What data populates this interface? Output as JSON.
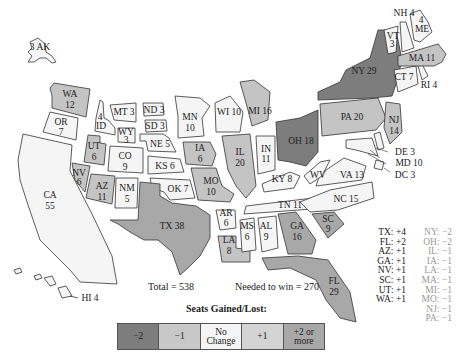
{
  "colors": {
    "minus2": "#7d7d7d",
    "minus1": "#c8c8c8",
    "no_change": "#f5f5f5",
    "plus1": "#d4d4d4",
    "plus2": "#a8a8a8",
    "outline": "#333333"
  },
  "states": [
    {
      "abbr": "AK",
      "votes": 3,
      "change": 0
    },
    {
      "abbr": "WA",
      "votes": 12,
      "change": 1
    },
    {
      "abbr": "OR",
      "votes": 7,
      "change": 0
    },
    {
      "abbr": "CA",
      "votes": 55,
      "change": 0
    },
    {
      "abbr": "ID",
      "votes": 4,
      "change": 0
    },
    {
      "abbr": "NV",
      "votes": 6,
      "change": 1
    },
    {
      "abbr": "UT",
      "votes": 6,
      "change": 1
    },
    {
      "abbr": "AZ",
      "votes": 11,
      "change": 1
    },
    {
      "abbr": "MT",
      "votes": 3,
      "change": 0
    },
    {
      "abbr": "WY",
      "votes": 3,
      "change": 0
    },
    {
      "abbr": "CO",
      "votes": 9,
      "change": 0
    },
    {
      "abbr": "NM",
      "votes": 5,
      "change": 0
    },
    {
      "abbr": "ND",
      "votes": 3,
      "change": 0
    },
    {
      "abbr": "SD",
      "votes": 3,
      "change": 0
    },
    {
      "abbr": "NE",
      "votes": 5,
      "change": 0
    },
    {
      "abbr": "KS",
      "votes": 6,
      "change": 0
    },
    {
      "abbr": "OK",
      "votes": 7,
      "change": 0
    },
    {
      "abbr": "TX",
      "votes": 38,
      "change": 4
    },
    {
      "abbr": "MN",
      "votes": 10,
      "change": 0
    },
    {
      "abbr": "IA",
      "votes": 6,
      "change": -1
    },
    {
      "abbr": "MO",
      "votes": 10,
      "change": -1
    },
    {
      "abbr": "AR",
      "votes": 6,
      "change": 0
    },
    {
      "abbr": "LA",
      "votes": 8,
      "change": -1
    },
    {
      "abbr": "WI",
      "votes": 10,
      "change": 0
    },
    {
      "abbr": "IL",
      "votes": 20,
      "change": -1
    },
    {
      "abbr": "MI",
      "votes": 16,
      "change": -1
    },
    {
      "abbr": "IN",
      "votes": 11,
      "change": 0
    },
    {
      "abbr": "OH",
      "votes": 18,
      "change": -2
    },
    {
      "abbr": "KY",
      "votes": 8,
      "change": 0
    },
    {
      "abbr": "TN",
      "votes": 11,
      "change": 0
    },
    {
      "abbr": "MS",
      "votes": 6,
      "change": 0
    },
    {
      "abbr": "AL",
      "votes": 9,
      "change": 0
    },
    {
      "abbr": "GA",
      "votes": 16,
      "change": 1
    },
    {
      "abbr": "FL",
      "votes": 29,
      "change": 2
    },
    {
      "abbr": "SC",
      "votes": 9,
      "change": 1
    },
    {
      "abbr": "NC",
      "votes": 15,
      "change": 0
    },
    {
      "abbr": "VA",
      "votes": 13,
      "change": 0
    },
    {
      "abbr": "WV",
      "votes": 5,
      "change": 0
    },
    {
      "abbr": "PA",
      "votes": 20,
      "change": -1
    },
    {
      "abbr": "NY",
      "votes": 29,
      "change": -2
    },
    {
      "abbr": "NJ",
      "votes": 14,
      "change": -1
    },
    {
      "abbr": "DE",
      "votes": 3,
      "change": 0
    },
    {
      "abbr": "MD",
      "votes": 10,
      "change": 0
    },
    {
      "abbr": "DC",
      "votes": 3,
      "change": 0
    },
    {
      "abbr": "CT",
      "votes": 7,
      "change": 0
    },
    {
      "abbr": "RI",
      "votes": 4,
      "change": 0
    },
    {
      "abbr": "MA",
      "votes": 11,
      "change": -1
    },
    {
      "abbr": "VT",
      "votes": 3,
      "change": 0
    },
    {
      "abbr": "NH",
      "votes": 4,
      "change": 0
    },
    {
      "abbr": "ME",
      "votes": 4,
      "change": 0
    },
    {
      "abbr": "HI",
      "votes": 4,
      "change": 0
    }
  ],
  "labels": {
    "AK": "3 AK",
    "WA": "WA",
    "WA_n": "12",
    "OR": "OR",
    "OR_n": "7",
    "CA": "CA",
    "CA_n": "55",
    "ID": "ID",
    "ID_n": "4",
    "NV": "NV",
    "NV_n": "6",
    "UT": "UT",
    "UT_n": "6",
    "AZ": "AZ",
    "AZ_n": "11",
    "MT": "MT 3",
    "WY": "WY",
    "WY_n": "3",
    "CO": "CO",
    "CO_n": "9",
    "NM": "NM",
    "NM_n": "5",
    "ND": "ND 3",
    "SD": "SD 3",
    "NE": "NE 5",
    "KS": "KS 6",
    "OK": "OK 7",
    "TX": "TX 38",
    "MN": "MN",
    "MN_n": "10",
    "IA": "IA",
    "IA_n": "6",
    "MO": "MO",
    "MO_n": "10",
    "AR": "AR",
    "AR_n": "6",
    "LA": "LA",
    "LA_n": "8",
    "WI": "WI 10",
    "IL": "IL",
    "IL_n": "20",
    "MI": "MI 16",
    "IN": "IN",
    "IN_n": "11",
    "OH": "OH 18",
    "KY": "KY 8",
    "TN": "TN 11",
    "MS": "MS",
    "MS_n": "6",
    "AL": "AL",
    "AL_n": "9",
    "GA": "GA",
    "GA_n": "16",
    "FL": "FL",
    "FL_n": "29",
    "SC": "SC",
    "SC_n": "9",
    "NC": "NC 15",
    "VA": "VA 13",
    "WV": "WV",
    "PA": "PA 20",
    "NY": "NY 29",
    "NJ": "NJ",
    "NJ_n": "14",
    "DE": "DE 3",
    "MD": "MD 10",
    "DC": "DC 3",
    "CT": "CT 7",
    "RI": "RI 4",
    "MA": "MA 11",
    "VT": "VT",
    "VT_n": "3",
    "NH": "NH 4",
    "ME": "ME",
    "ME_n": "4",
    "HI": "HI 4"
  },
  "summary": {
    "total": "Total = 538",
    "needed": "Needed to win = 270"
  },
  "gains": [
    "TX: +4",
    "FL: +2",
    "AZ: +1",
    "GA: +1",
    "NV: +1",
    "SC: +1",
    "UT: +1",
    "WA: +1"
  ],
  "losses": [
    "NY: −2",
    "OH: −2",
    "IL: −1",
    "IA: −1",
    "LA: −1",
    "MA: −1",
    "MI: −1",
    "MO: −1",
    "NJ: −1",
    "PA: −1"
  ],
  "legend": {
    "title": "Seats Gained/Lost:",
    "items": [
      {
        "label": "−2",
        "color": "#7d7d7d"
      },
      {
        "label": "−1",
        "color": "#c8c8c8"
      },
      {
        "label": "No Change",
        "color": "#f5f5f5"
      },
      {
        "label": "+1",
        "color": "#d4d4d4"
      },
      {
        "label": "+2 or more",
        "color": "#a8a8a8"
      }
    ]
  }
}
